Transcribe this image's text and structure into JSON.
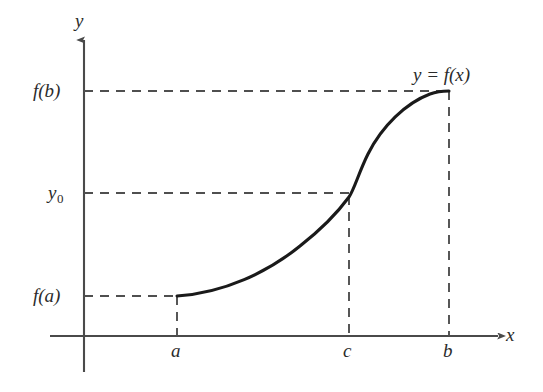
{
  "figure": {
    "kind": "math-function-graph",
    "background_color": "#ffffff",
    "line_color": "#2b2b2b",
    "curve_color": "#1a1a1a",
    "dash_color": "#5a5a5a",
    "axes": {
      "y_axis_label": "y",
      "x_axis_label": "x"
    },
    "curve_label": "y = f(x)",
    "y_ticks": [
      {
        "id": "fb",
        "label": "f(b)",
        "has_subscript": false
      },
      {
        "id": "y0",
        "label": "y",
        "subscript": "0",
        "has_subscript": true
      },
      {
        "id": "fa",
        "label": "f(a)",
        "has_subscript": false
      }
    ],
    "x_ticks": [
      {
        "id": "a",
        "label": "a"
      },
      {
        "id": "c",
        "label": "c"
      },
      {
        "id": "b",
        "label": "b"
      }
    ]
  },
  "chart_data": {
    "type": "line",
    "title": "",
    "xlabel": "x",
    "ylabel": "y",
    "grid": false,
    "legend": "none",
    "annotations": [
      {
        "text": "y = f(x)",
        "x_px": 413,
        "y_px": 64,
        "role": "curve-name"
      }
    ],
    "axis_ranges": {
      "x_px": [
        50,
        500
      ],
      "y_px": [
        38,
        372
      ],
      "x_origin_px": 84,
      "y_origin_px": 336
    },
    "x_tick_labels": [
      "a",
      "c",
      "b"
    ],
    "x_tick_positions_px": [
      177,
      349,
      449
    ],
    "y_tick_labels": [
      "f(a)",
      "y0",
      "f(b)"
    ],
    "y_tick_positions_px": [
      296,
      193,
      91
    ],
    "marked_points": [
      {
        "name": "(a, f(a))",
        "x_px": 177,
        "y_px": 296
      },
      {
        "name": "(c, y0)",
        "x_px": 349,
        "y_px": 193
      },
      {
        "name": "(b, f(b))",
        "x_px": 449,
        "y_px": 91
      }
    ],
    "curve_path": "M177,296 C224,293 268,272 300,246 C323,228 338,212 349,197 C354,190 359,172 368,154 C382,126 406,103 430,94 C438,91 444,91 449,91",
    "guide_lines": [
      {
        "orientation": "horizontal",
        "from_px": [
          84,
          91
        ],
        "to_px": [
          449,
          91
        ],
        "at_label": "f(b)"
      },
      {
        "orientation": "horizontal",
        "from_px": [
          84,
          193
        ],
        "to_px": [
          349,
          193
        ],
        "at_label": "y0"
      },
      {
        "orientation": "horizontal",
        "from_px": [
          84,
          296
        ],
        "to_px": [
          177,
          296
        ],
        "at_label": "f(a)"
      },
      {
        "orientation": "vertical",
        "from_px": [
          177,
          296
        ],
        "to_px": [
          177,
          336
        ],
        "at_label": "a"
      },
      {
        "orientation": "vertical",
        "from_px": [
          349,
          197
        ],
        "to_px": [
          349,
          336
        ],
        "at_label": "c"
      },
      {
        "orientation": "vertical",
        "from_px": [
          449,
          91
        ],
        "to_px": [
          449,
          336
        ],
        "at_label": "b"
      }
    ]
  }
}
